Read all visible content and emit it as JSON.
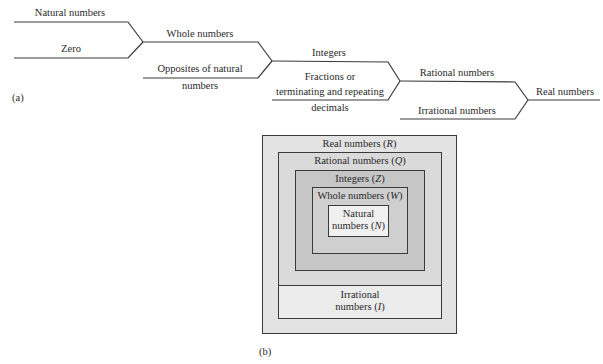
{
  "panel_a": {
    "tag": "(a)",
    "nodes": {
      "natural": "Natural numbers",
      "zero": "Zero",
      "whole": "Whole numbers",
      "opposites_line1": "Opposites of natural",
      "opposites_line2": "numbers",
      "integers": "Integers",
      "fractions_line1": "Fractions or",
      "fractions_line2": "terminating and repeating",
      "fractions_line3": "decimals",
      "rational": "Rational numbers",
      "irrational": "Irrational numbers",
      "real": "Real numbers"
    },
    "edges": [
      {
        "from": "Natural numbers",
        "to": "Whole numbers"
      },
      {
        "from": "Zero",
        "to": "Whole numbers"
      },
      {
        "from": "Whole numbers",
        "to": "Integers"
      },
      {
        "from": "Opposites of natural numbers",
        "to": "Integers"
      },
      {
        "from": "Integers",
        "to": "Rational numbers"
      },
      {
        "from": "Fractions or terminating and repeating decimals",
        "to": "Rational numbers"
      },
      {
        "from": "Rational numbers",
        "to": "Real numbers"
      },
      {
        "from": "Irrational numbers",
        "to": "Real numbers"
      }
    ]
  },
  "panel_b": {
    "tag": "(b)",
    "real": {
      "label": "Real numbers (",
      "symbol": "R",
      "close": ")",
      "fill": "#e3e3e3"
    },
    "rational": {
      "label": "Rational numbers (",
      "symbol": "Q",
      "close": ")",
      "fill": "#dadada"
    },
    "integers": {
      "label": "Integers (",
      "symbol": "Z",
      "close": ")",
      "fill": "#c6c6c6"
    },
    "whole": {
      "label": "Whole numbers (",
      "symbol": "W",
      "close": ")",
      "fill": "#cfcfcf"
    },
    "natural": {
      "line1": "Natural",
      "line2": "numbers (",
      "symbol": "N",
      "close": ")",
      "fill": "#f0f0f0"
    },
    "irrational": {
      "line1": "Irrational",
      "line2": "numbers (",
      "symbol": "I",
      "close": ")",
      "fill": "#ececec"
    }
  }
}
